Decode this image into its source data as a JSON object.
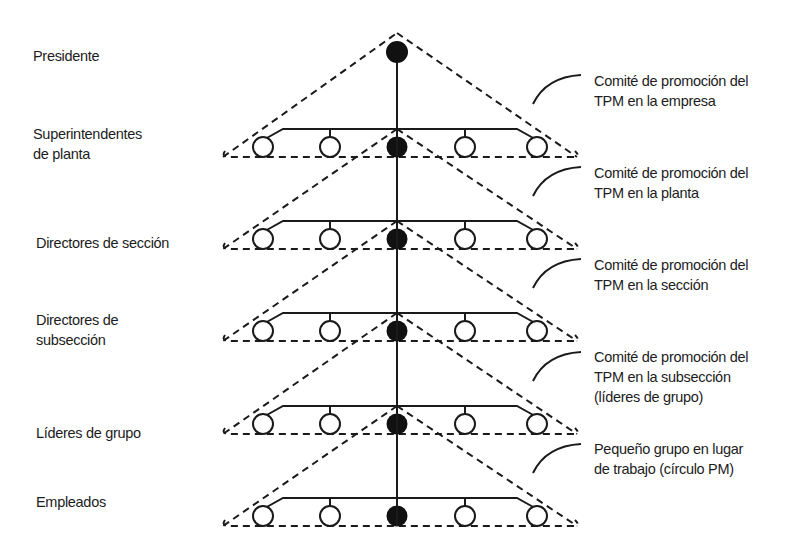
{
  "diagram": {
    "type": "organizational-hierarchy",
    "colors": {
      "ink": "#1a1a1a",
      "background": "#ffffff"
    },
    "levels": [
      {
        "id": "presidente",
        "label": "Presidente"
      },
      {
        "id": "superintendentes",
        "label": "Superintendentes\nde planta"
      },
      {
        "id": "directores-seccion",
        "label": "Directores de sección"
      },
      {
        "id": "directores-subseccion",
        "label": "Directores de\nsubsección"
      },
      {
        "id": "lideres-grupo",
        "label": "Líderes de grupo"
      },
      {
        "id": "empleados",
        "label": "Empleados"
      }
    ],
    "committees": [
      {
        "id": "comite-empresa",
        "label": "Comité de promoción del\nTPM en la empresa"
      },
      {
        "id": "comite-planta",
        "label": "Comité de promoción del\nTPM en la planta"
      },
      {
        "id": "comite-seccion",
        "label": "Comité de promoción del\nTPM en la sección"
      },
      {
        "id": "comite-subseccion",
        "label": "Comité de promoción del\nTPM en la subsección\n(líderes de grupo)"
      },
      {
        "id": "grupo-pm",
        "label": "Pequeño grupo en lugar\nde trabajo (círculo PM)"
      }
    ],
    "node_legend": {
      "filled_circle": "leader / member linking to upper level",
      "open_circle": "group member"
    },
    "members_per_tier": 5
  }
}
